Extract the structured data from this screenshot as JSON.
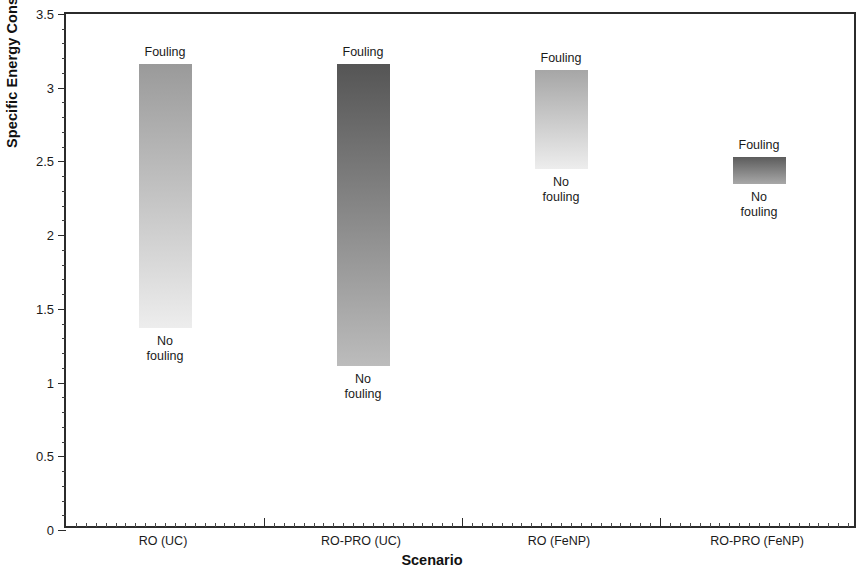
{
  "chart_data": {
    "type": "bar",
    "title": "",
    "subtitle": "",
    "xlabel": "Scenario",
    "ylabel_prefix": "Specific Energy Consumption (kWh/m",
    "ylabel_sup": "3",
    "ylabel_suffix": ")",
    "ylabel": "Specific Energy Consumption (kWh/m3)",
    "categories": [
      "RO (UC)",
      "RO-PRO (UC)",
      "RO (FeNP)",
      "RO-PRO (FeNP)"
    ],
    "ylim": [
      0,
      3.5
    ],
    "y_major_ticks": [
      0,
      0.5,
      1,
      1.5,
      2,
      2.5,
      3,
      3.5
    ],
    "y_tick_labels": [
      "0",
      "0.5",
      "1",
      "1.5",
      "2",
      "2.5",
      "3",
      "3.5"
    ],
    "y_minor_tick_interval": 0.1,
    "grid": false,
    "legend": "none",
    "bar_range_top_label": "Fouling",
    "bar_range_bottom_label_line1": "No",
    "bar_range_bottom_label_line2": "fouling",
    "series": [
      {
        "name": "Fouling",
        "values": [
          3.16,
          3.16,
          3.12,
          2.53
        ]
      },
      {
        "name": "No fouling",
        "values": [
          1.37,
          1.11,
          2.45,
          2.35
        ]
      }
    ],
    "bars": [
      {
        "category": "RO (UC)",
        "top_value": 3.16,
        "bottom_value": 1.37,
        "top_label": "Fouling",
        "bottom_label": "No fouling",
        "fill_top_color": "#9a9a9a",
        "fill_bottom_color": "#ededed"
      },
      {
        "category": "RO-PRO (UC)",
        "top_value": 3.16,
        "bottom_value": 1.11,
        "top_label": "Fouling",
        "bottom_label": "No fouling",
        "fill_top_color": "#555555",
        "fill_bottom_color": "#bcbcbc"
      },
      {
        "category": "RO (FeNP)",
        "top_value": 3.12,
        "bottom_value": 2.45,
        "top_label": "Fouling",
        "bottom_label": "No fouling",
        "fill_top_color": "#a6a6a6",
        "fill_bottom_color": "#ededed"
      },
      {
        "category": "RO-PRO (FeNP)",
        "top_value": 2.53,
        "bottom_value": 2.35,
        "top_label": "Fouling",
        "bottom_label": "No fouling",
        "fill_top_color": "#5c5c5c",
        "fill_bottom_color": "#a8a8a8"
      }
    ],
    "axis_color": "#2b2b2b",
    "background_color": "#ffffff"
  }
}
